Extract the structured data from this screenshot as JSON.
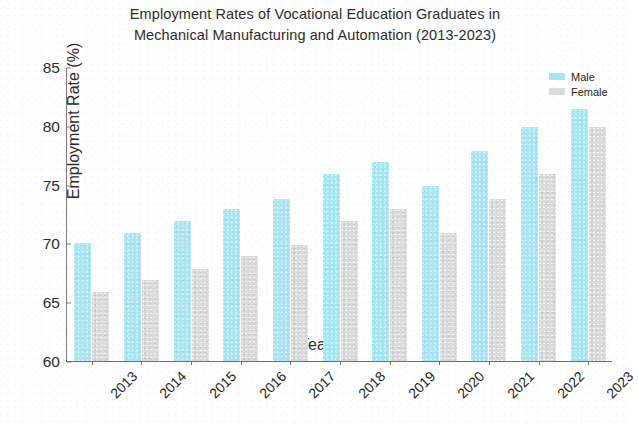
{
  "chart_data": {
    "type": "bar",
    "title": "Employment Rates of Vocational Education Graduates in Mechanical Manufacturing and Automation (2013-2023)",
    "title_lines": [
      "Employment Rates of Vocational Education Graduates in",
      "Mechanical Manufacturing and Automation (2013-2023)"
    ],
    "xlabel": "Year",
    "ylabel": "Employment Rate (%)",
    "categories": [
      "2013",
      "2014",
      "2015",
      "2016",
      "2017",
      "2018",
      "2019",
      "2020",
      "2021",
      "2022",
      "2023"
    ],
    "series": [
      {
        "name": "Male",
        "color": "#a5e6f5",
        "values": [
          70.0,
          70.9,
          71.9,
          72.9,
          73.8,
          75.9,
          76.9,
          74.9,
          77.9,
          79.9,
          81.4
        ]
      },
      {
        "name": "Female",
        "color": "#dcdcdc",
        "values": [
          65.9,
          66.9,
          67.8,
          68.9,
          69.9,
          71.9,
          72.9,
          70.9,
          73.8,
          75.9,
          79.9
        ]
      }
    ],
    "ylim": [
      60,
      85
    ],
    "yticks": [
      60,
      65,
      70,
      75,
      80,
      85
    ],
    "ytick_labels": [
      "60",
      "65",
      "70",
      "75",
      "80",
      "85"
    ],
    "grid": false,
    "legend_position": "upper right",
    "xtick_rotation": -45
  },
  "legend": {
    "entries": [
      {
        "label": "Male",
        "color": "#a5e6f5"
      },
      {
        "label": "Female",
        "color": "#dcdcdc"
      }
    ]
  }
}
